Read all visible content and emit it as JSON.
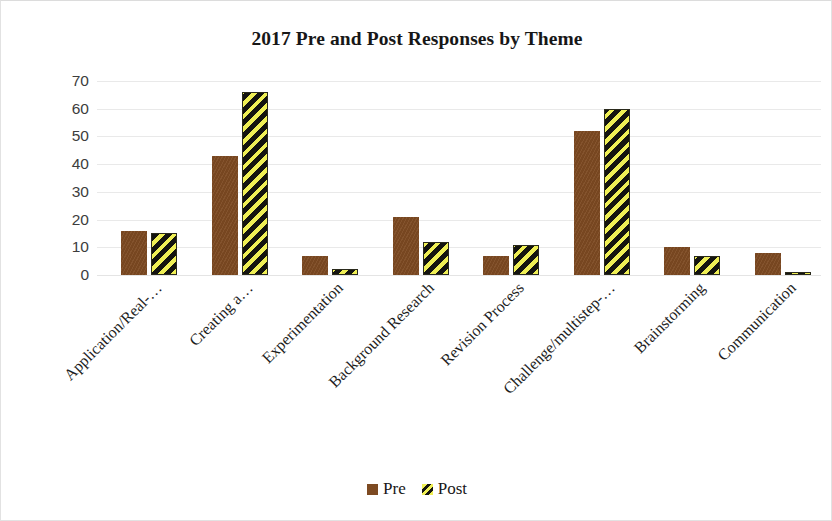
{
  "chart_data": {
    "type": "bar",
    "title": "2017 Pre and Post Responses by Theme",
    "xlabel": "",
    "ylabel": "",
    "ylim": [
      0,
      70
    ],
    "ytick_step": 10,
    "yticks": [
      "70",
      "60",
      "50",
      "40",
      "30",
      "20",
      "10",
      "0"
    ],
    "grid": true,
    "legend_position": "bottom",
    "categories": [
      "Application/Real-…",
      "Creating a…",
      "Experimentation",
      "Background Research",
      "Revision Process",
      "Challenge/multistep-…",
      "Brainstorming",
      "Communication"
    ],
    "series": [
      {
        "name": "Pre",
        "color": "#7d4a22",
        "values": [
          16,
          43,
          7,
          21,
          7,
          52,
          10,
          8
        ]
      },
      {
        "name": "Post",
        "color": "#efef55",
        "pattern": "diagonal-stripe-yellow-black",
        "values": [
          15,
          66,
          2,
          12,
          11,
          60,
          7,
          1
        ]
      }
    ]
  },
  "legend": {
    "items": [
      {
        "label": "Pre",
        "swatch": "pre"
      },
      {
        "label": "Post",
        "swatch": "post"
      }
    ]
  }
}
